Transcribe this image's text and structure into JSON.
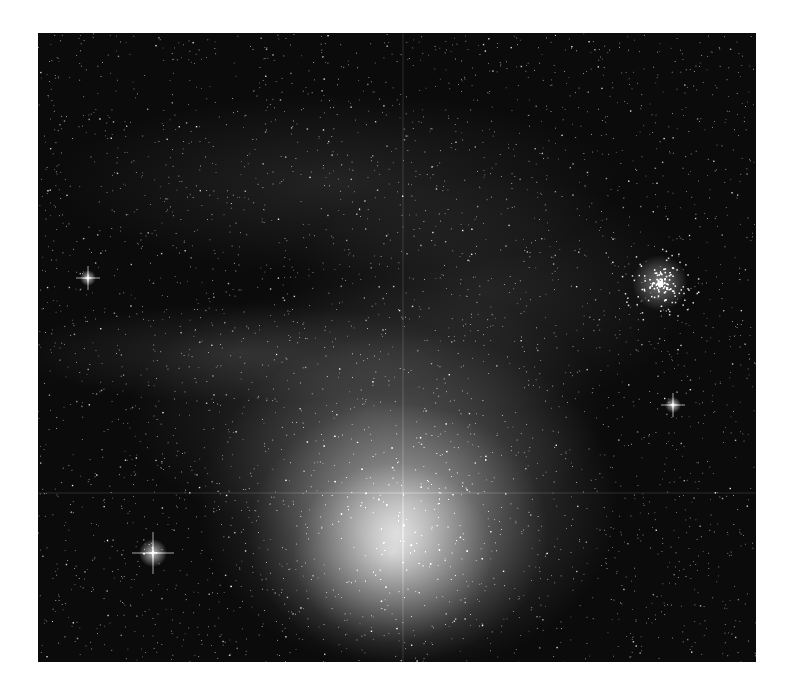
{
  "image": {
    "subject": "emission/reflection nebula with dense star field",
    "palette": {
      "background": "#ffffff",
      "sky": "#0b0b0b",
      "nebula_core": "#e6e6e6",
      "nebula_mid": "#8a8a8a",
      "stars": "#ffffff"
    },
    "frame": {
      "left": 38,
      "top": 33,
      "width": 718,
      "height": 629
    },
    "features": [
      {
        "name": "nebula-core",
        "x": 370,
        "y": 480,
        "rx": 170,
        "ry": 150
      },
      {
        "name": "star-cluster",
        "x": 622,
        "y": 250,
        "r": 20
      },
      {
        "name": "bright-star-left",
        "x": 115,
        "y": 520,
        "r": 7
      },
      {
        "name": "bright-star-upper-left",
        "x": 50,
        "y": 245,
        "r": 4
      },
      {
        "name": "bright-star-right",
        "x": 635,
        "y": 372,
        "r": 4
      }
    ],
    "star_count": 3500
  }
}
